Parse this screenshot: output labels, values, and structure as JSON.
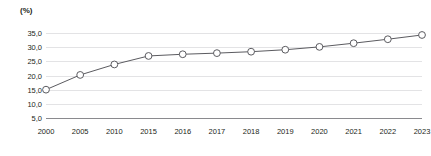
{
  "chart_data": {
    "type": "line",
    "title": "",
    "subtitle": "",
    "xlabel": "",
    "ylabel": "(%)",
    "unit_label": "(%)",
    "categories": [
      "2000",
      "2005",
      "2010",
      "2015",
      "2016",
      "2017",
      "2018",
      "2019",
      "2020",
      "2021",
      "2022",
      "2023"
    ],
    "values": [
      15.0,
      20.2,
      23.9,
      26.9,
      27.5,
      27.9,
      28.4,
      29.1,
      30.1,
      31.4,
      32.8,
      34.3
    ],
    "series": [
      {
        "name": "",
        "values": [
          15.0,
          20.2,
          23.9,
          26.9,
          27.5,
          27.9,
          28.4,
          29.1,
          30.1,
          31.4,
          32.8,
          34.3
        ]
      }
    ],
    "ylim": [
      5.0,
      35.0
    ],
    "yticks": [
      35.0,
      30.0,
      25.0,
      20.0,
      15.0,
      10.0,
      5.0
    ],
    "ytick_labels": [
      "35,0",
      "30,0",
      "25,0",
      "20,0",
      "15,0",
      "10,0",
      "5,0"
    ],
    "xtick_labels": [
      "2000",
      "2005",
      "2010",
      "2015",
      "2016",
      "2017",
      "2018",
      "2019",
      "2020",
      "2021",
      "2022",
      "2023"
    ],
    "grid": true,
    "legend": false,
    "legend_position": "none",
    "marker": "circle-open",
    "colors": {
      "line": "#5b5b60",
      "marker_fill": "#ffffff",
      "marker_stroke": "#5b5b60",
      "gridline": "#e3e3e5",
      "axis": "#8a8a8e",
      "text": "#231f20",
      "background": "#ffffff"
    }
  }
}
